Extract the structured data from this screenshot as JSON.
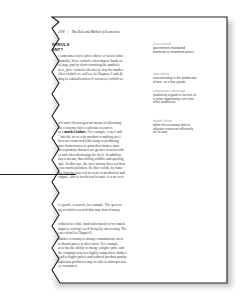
{
  "running_head": {
    "page_number": "1000",
    "separator": "|",
    "chapter_title": "The Role and Method of Economics"
  },
  "section_heading": [
    "NTROLS",
    "ENT?"
  ],
  "body_paragraphs": [
    {
      "lines": [
        "s sometimes force prices above or below what",
        "formally, these controls often impose harm on",
        "in large part by short-circuiting the market's",
        "ut is, price controls effectively stop the market",
        "ellers (which we will see in Chapters 3 and 4);",
        "ding to a misallocation of resources (which we"
      ]
    },
    {
      "lines": [
        "tive and efficient general means of allocating",
        "the economy fails to allocate resources",
        "as a market failure. For example, a steel mill",
        "\" into the air as a by-product of making steel.",
        "hers not connected with using or producing",
        "ause homeowners to paint their homes more",
        "nt respiratory diseases are greater in areas with",
        "es and often shortening life itself. In addition,",
        "into a stream, thus killing wildlife and spoiling",
        "ople. In this case, the steel factory does not bear",
        "s too much pollution. In other words, by trans-",
        "the firm has lowered its costs of production and",
        "output—this is inefficient because it is an over-"
      ],
      "bold_term": "market failure."
    },
    {
      "lines": [
        "f a good—research, for example. The govern-",
        "ng scientific research that may benefit many"
      ]
    },
    {
      "lines": [
        "roduced too little (underallocation) or too much",
        "improve society's well-being by intervening. The",
        "eater detail in Chapter 6."
      ]
    },
    {
      "lines": [
        "market economy to always communicate accu-",
        "to distort prices in their favor. For example,",
        "area has the ability to charge a higher price and",
        "the company was in a highly competitive market.",
        "lead to higher prices and reduced product quality.",
        "uspicious producers may be able to misrepresent",
        "ey consumers."
      ]
    }
  ],
  "margin_glossary": [
    {
      "term": "price controls",
      "definition": [
        "government-mandated",
        "minimum or maximum prices"
      ]
    },
    {
      "term": "specializing",
      "definition": [
        "concentrating in the production",
        "of one, or a few, goods"
      ]
    },
    {
      "term": "comparative advantage",
      "definition": [
        "producing a good or service at",
        "a lower opportunity cost than",
        "other producers"
      ]
    },
    {
      "term": "market failure",
      "definition": [
        "when the economy fails to",
        "allocate resources efficiently",
        "on its own"
      ]
    }
  ],
  "colors": {
    "page_border": "#1e1e1e",
    "shadow": "#bdbdbd",
    "glossary_term": "#9a9a9a",
    "body_text": "#3a3a3a"
  }
}
